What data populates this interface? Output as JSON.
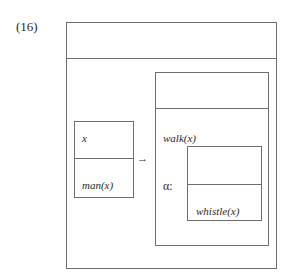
{
  "example_number": "(16)",
  "outer_drs": {
    "universe": "",
    "conditions": {
      "antecedent": {
        "universe": "x",
        "condition": "man(x)"
      },
      "arrow": "→",
      "consequent": {
        "universe": "",
        "condition": "walk(x)",
        "alpha_label": "α:",
        "embedded": {
          "universe": "",
          "condition": "whistle(x)"
        }
      }
    }
  }
}
